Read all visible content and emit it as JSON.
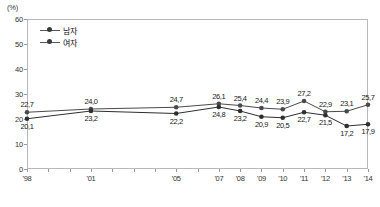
{
  "chart_data": {
    "type": "line",
    "title": "",
    "xlabel": "",
    "ylabel": "",
    "unit_label": "(%)",
    "ylim": [
      0,
      60
    ],
    "yticks": [
      0,
      10,
      20,
      30,
      40,
      50,
      60
    ],
    "grid": false,
    "legend_position": "top-left",
    "categories": [
      "'98",
      "'01",
      "'05",
      "'07",
      "'08",
      "'09",
      "'10",
      "'11",
      "'12",
      "'13",
      "'14"
    ],
    "x_positions": [
      1998,
      2001,
      2005,
      2007,
      2008,
      2009,
      2010,
      2011,
      2012,
      2013,
      2014
    ],
    "x_axis_range": [
      1998,
      2014
    ],
    "x_all_ticks": [
      1998,
      1999,
      2000,
      2001,
      2002,
      2003,
      2004,
      2005,
      2006,
      2007,
      2008,
      2009,
      2010,
      2011,
      2012,
      2013,
      2014
    ],
    "series": [
      {
        "name": "남자",
        "values": [
          22.7,
          24.0,
          24.7,
          26.1,
          25.4,
          24.4,
          23.9,
          27.2,
          22.9,
          23.1,
          25.7
        ],
        "labels": [
          "22,7",
          "24,0",
          "24,7",
          "26,1",
          "25,4",
          "24,4",
          "23,9",
          "27,2",
          "22,9",
          "23,1",
          "25,7"
        ],
        "color": "#4a4a4a",
        "marker": "circle",
        "label_side": "above"
      },
      {
        "name": "여자",
        "values": [
          20.1,
          23.2,
          22.2,
          24.8,
          23.2,
          20.9,
          20.5,
          22.7,
          21.5,
          17.2,
          17.9
        ],
        "labels": [
          "20,1",
          "23,2",
          "22,2",
          "24,8",
          "23,2",
          "20,9",
          "20,5",
          "22,7",
          "21,5",
          "17,2",
          "17,9"
        ],
        "color": "#2e2e2e",
        "marker": "circle",
        "label_side": "below"
      }
    ]
  },
  "legend": {
    "items": [
      {
        "label": "남자"
      },
      {
        "label": "여자"
      }
    ]
  },
  "caption": {
    "text": ""
  }
}
